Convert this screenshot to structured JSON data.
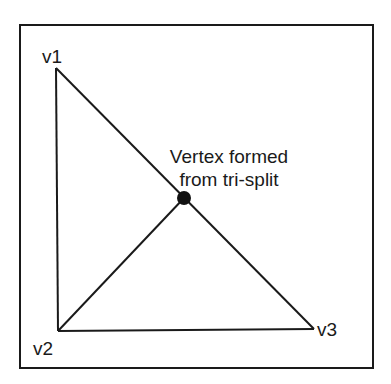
{
  "diagram": {
    "vertices": [
      {
        "id": "v1",
        "label": "v1"
      },
      {
        "id": "v2",
        "label": "v2"
      },
      {
        "id": "v3",
        "label": "v3"
      }
    ],
    "annotation": {
      "line1": "Vertex formed",
      "line2": "from tri-split"
    },
    "colors": {
      "stroke": "#1a1a1a",
      "background": "#ffffff"
    }
  }
}
